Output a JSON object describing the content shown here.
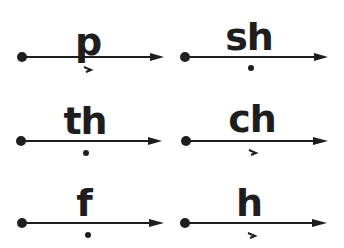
{
  "diagram": {
    "type": "phonics-sound-arrows",
    "colors": {
      "ink": "#1e1e1e",
      "background": "#ffffff"
    },
    "items": [
      {
        "sound": "p",
        "mark": "short-arrow",
        "column": "left",
        "row": 1
      },
      {
        "sound": "sh",
        "mark": "dot",
        "column": "right",
        "row": 1
      },
      {
        "sound": "th",
        "mark": "dot",
        "column": "left",
        "row": 2
      },
      {
        "sound": "ch",
        "mark": "short-arrow",
        "column": "right",
        "row": 2
      },
      {
        "sound": "f",
        "mark": "dot",
        "column": "left",
        "row": 3
      },
      {
        "sound": "h",
        "mark": "short-arrow",
        "column": "right",
        "row": 3
      }
    ]
  }
}
